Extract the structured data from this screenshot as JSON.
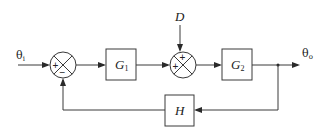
{
  "diagram": {
    "type": "feedback control block diagram",
    "input_signal": {
      "symbol": "θ",
      "subscript": "i"
    },
    "output_signal": {
      "symbol": "θ",
      "subscript": "o"
    },
    "disturbance": "D",
    "blocks": [
      {
        "id": "G1",
        "symbol": "G",
        "subscript": "1"
      },
      {
        "id": "G2",
        "symbol": "G",
        "subscript": "2"
      },
      {
        "id": "H",
        "symbol": "H",
        "subscript": ""
      }
    ],
    "summing_junctions": [
      {
        "id": "sum1",
        "signs": {
          "left": "+",
          "bottom": "−"
        }
      },
      {
        "id": "sum2",
        "signs": {
          "top": "+",
          "left": "+"
        }
      }
    ],
    "connections": [
      "θi → sum1(+)",
      "sum1 → G1",
      "G1 → sum2(+)",
      "D → sum2(+)",
      "sum2 → G2",
      "G2 → θo",
      "θo → H",
      "H → sum1(−)"
    ]
  }
}
